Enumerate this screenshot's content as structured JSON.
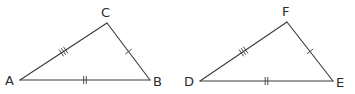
{
  "figure": {
    "triangles": [
      {
        "name": "ABC",
        "vertices": {
          "A": {
            "label": "A",
            "x": 20,
            "y": 80,
            "lx": 5,
            "ly": 85
          },
          "B": {
            "label": "B",
            "x": 150,
            "y": 80,
            "lx": 153,
            "ly": 86
          },
          "C": {
            "label": "C",
            "x": 107,
            "y": 23,
            "lx": 101,
            "ly": 17
          }
        },
        "sides": [
          {
            "from": "A",
            "to": "C",
            "ticks": 3
          },
          {
            "from": "C",
            "to": "B",
            "ticks": 1
          },
          {
            "from": "A",
            "to": "B",
            "ticks": 2
          }
        ]
      },
      {
        "name": "DEF",
        "vertices": {
          "D": {
            "label": "D",
            "x": 200,
            "y": 81,
            "lx": 184,
            "ly": 86
          },
          "E": {
            "label": "E",
            "x": 333,
            "y": 81,
            "lx": 336,
            "ly": 87
          },
          "F": {
            "label": "F",
            "x": 287,
            "y": 22,
            "lx": 282,
            "ly": 16
          }
        },
        "sides": [
          {
            "from": "D",
            "to": "F",
            "ticks": 3
          },
          {
            "from": "F",
            "to": "E",
            "ticks": 1
          },
          {
            "from": "D",
            "to": "E",
            "ticks": 2
          }
        ]
      }
    ],
    "colors": {
      "stroke": "#3a3a3a",
      "label": "#2a2a2a",
      "background": "#ffffff"
    }
  }
}
